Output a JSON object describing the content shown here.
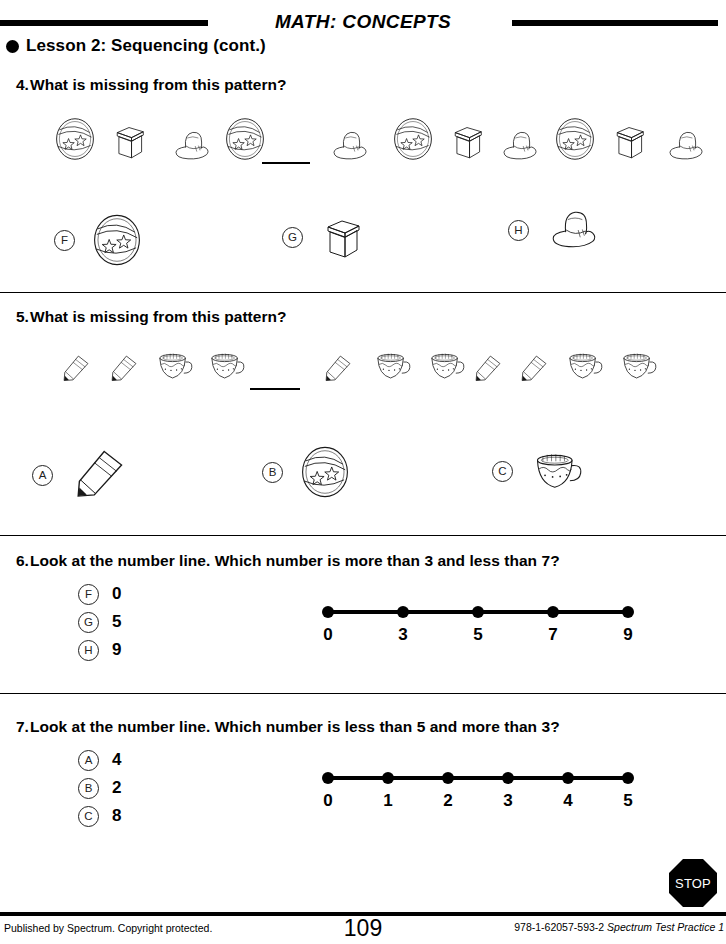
{
  "header": {
    "subject_title": "MATH: CONCEPTS",
    "lesson_title": "Lesson 2: Sequencing (cont.)",
    "bullet_icon": "filled-circle-bullet"
  },
  "questions": [
    {
      "number": "4.",
      "prompt": "What is missing from this pattern?",
      "pattern": [
        "ball",
        "box",
        "hat",
        "ball",
        "blank",
        "hat",
        "ball",
        "box",
        "hat",
        "ball",
        "box",
        "hat"
      ],
      "choices": [
        {
          "letter": "F",
          "icon": "ball"
        },
        {
          "letter": "G",
          "icon": "box"
        },
        {
          "letter": "H",
          "icon": "hat"
        }
      ]
    },
    {
      "number": "5.",
      "prompt": "What is missing from this pattern?",
      "pattern": [
        "pencil",
        "pencil",
        "cup",
        "cup",
        "blank",
        "pencil",
        "cup",
        "cup",
        "pencil",
        "pencil",
        "cup",
        "cup"
      ],
      "choices": [
        {
          "letter": "A",
          "icon": "pencil"
        },
        {
          "letter": "B",
          "icon": "ball"
        },
        {
          "letter": "C",
          "icon": "cup"
        }
      ]
    },
    {
      "number": "6.",
      "prompt": "Look at the number line. Which number is more than 3 and less than 7?",
      "choices": [
        {
          "letter": "F",
          "value": "0"
        },
        {
          "letter": "G",
          "value": "5"
        },
        {
          "letter": "H",
          "value": "9"
        }
      ],
      "number_line": {
        "ticks": [
          "0",
          "3",
          "5",
          "7",
          "9"
        ]
      }
    },
    {
      "number": "7.",
      "prompt": "Look at the number line. Which number is less than 5 and more than 3?",
      "choices": [
        {
          "letter": "A",
          "value": "4"
        },
        {
          "letter": "B",
          "value": "2"
        },
        {
          "letter": "C",
          "value": "8"
        }
      ],
      "number_line": {
        "ticks": [
          "0",
          "1",
          "2",
          "3",
          "4",
          "5"
        ]
      }
    }
  ],
  "footer": {
    "stop_label": "STOP",
    "stop_icon": "stop-octagon-icon",
    "publisher": "Published by Spectrum. Copyright protected.",
    "page_number": "109",
    "isbn": "978-1-62057-593-2",
    "book_title": "Spectrum Test Practice 1"
  },
  "colors": {
    "ink": "#000000",
    "rule": "#000000"
  }
}
